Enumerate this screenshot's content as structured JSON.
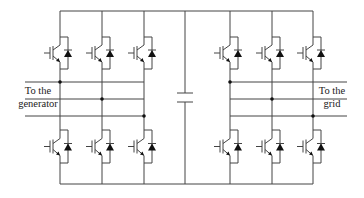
{
  "diagram": {
    "colors": {
      "line": "#444444",
      "fill": "#111111",
      "background": "#ffffff"
    },
    "rails": {
      "top_y": 11,
      "bottom_y": 184,
      "x_start": 60,
      "x_end": 313
    },
    "generator_side": {
      "legs_x": [
        60,
        102,
        144
      ],
      "phase_lines_y": [
        82,
        99,
        116
      ],
      "line_start_x": 25,
      "label_line1": "To the",
      "label_line2": "generator"
    },
    "grid_side": {
      "legs_x": [
        230,
        272,
        313
      ],
      "phase_lines_y": [
        82,
        99,
        116
      ],
      "line_end_x": 347,
      "label_line1": "To the",
      "label_line2": "grid"
    },
    "dc_link": {
      "x": 185,
      "plate_top_y": 93,
      "plate_bottom_y": 102,
      "plate_half_width": 8,
      "symbol": "capacitor"
    },
    "switch": {
      "type": "IGBT with antiparallel diode",
      "upper_box": [
        37,
        69
      ],
      "lower_box": [
        130,
        163
      ]
    }
  }
}
